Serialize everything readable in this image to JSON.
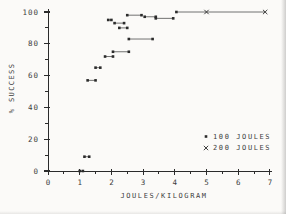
{
  "figure": {
    "background": "#fbfaf8",
    "ink": "#2b2b2b",
    "line_color": "#4f4f4f",
    "text_color": "#3d3d3d"
  },
  "chart_data": {
    "type": "scatter",
    "title": "",
    "xlabel": "JOULES/KILOGRAM",
    "ylabel": "% SUCCESS",
    "xlim": [
      0,
      7
    ],
    "ylim": [
      0,
      100
    ],
    "x_major_ticks": [
      0,
      1,
      2,
      3,
      4,
      5,
      6,
      7
    ],
    "x_tick_labels": [
      "0",
      "1",
      "2",
      "3",
      "4",
      "5",
      "6",
      "7"
    ],
    "x_minor_step": 0.5,
    "y_major_ticks": [
      0,
      20,
      40,
      60,
      80,
      100
    ],
    "y_tick_labels": [
      "0",
      "20",
      "40",
      "60",
      "80",
      "100"
    ],
    "y_minor_step": 10,
    "grid": false,
    "legend_position": "lower-right",
    "series": [
      {
        "name": "100 JOULES",
        "marker": "dot"
      },
      {
        "name": "200 JOULES",
        "marker": "x"
      }
    ],
    "segments": [
      {
        "pct": 0,
        "points": [
          {
            "x": 1.0,
            "m": "dot"
          },
          {
            "x": 1.1,
            "m": "dot"
          }
        ]
      },
      {
        "pct": 9,
        "points": [
          {
            "x": 1.15,
            "m": "dot"
          },
          {
            "x": 1.3,
            "m": "dot"
          }
        ]
      },
      {
        "pct": 57,
        "points": [
          {
            "x": 1.25,
            "m": "dot"
          },
          {
            "x": 1.5,
            "m": "dot"
          }
        ]
      },
      {
        "pct": 65,
        "points": [
          {
            "x": 1.5,
            "m": "dot"
          },
          {
            "x": 1.65,
            "m": "dot"
          }
        ]
      },
      {
        "pct": 72,
        "points": [
          {
            "x": 1.8,
            "m": "dot"
          },
          {
            "x": 2.05,
            "m": "dot"
          }
        ]
      },
      {
        "pct": 75,
        "points": [
          {
            "x": 2.05,
            "m": "dot"
          },
          {
            "x": 2.55,
            "m": "dot"
          }
        ]
      },
      {
        "pct": 83,
        "points": [
          {
            "x": 2.55,
            "m": "dot"
          },
          {
            "x": 3.3,
            "m": "dot"
          }
        ]
      },
      {
        "pct": 90,
        "points": [
          {
            "x": 2.25,
            "m": "dot"
          },
          {
            "x": 2.5,
            "m": "dot"
          }
        ]
      },
      {
        "pct": 93,
        "points": [
          {
            "x": 2.1,
            "m": "dot"
          },
          {
            "x": 2.4,
            "m": "dot"
          }
        ]
      },
      {
        "pct": 95,
        "points": [
          {
            "x": 1.9,
            "m": "dot"
          },
          {
            "x": 2.0,
            "m": "dot"
          }
        ]
      },
      {
        "pct": 98,
        "points": [
          {
            "x": 2.5,
            "m": "dot"
          },
          {
            "x": 2.95,
            "m": "dot"
          }
        ]
      },
      {
        "pct": 97,
        "points": [
          {
            "x": 3.05,
            "m": "dot"
          },
          {
            "x": 3.4,
            "m": "dot"
          }
        ]
      },
      {
        "pct": 96,
        "points": [
          {
            "x": 3.4,
            "m": "dot"
          },
          {
            "x": 3.95,
            "m": "dot"
          }
        ]
      },
      {
        "pct": 100,
        "points": [
          {
            "x": 4.05,
            "m": "dot"
          },
          {
            "x": 5.0,
            "m": "x"
          },
          {
            "x": 6.85,
            "m": "x"
          }
        ]
      }
    ]
  },
  "legend": {
    "items": [
      {
        "marker": "dot",
        "label": "100 JOULES"
      },
      {
        "marker": "x",
        "label": "200 JOULES"
      }
    ]
  }
}
